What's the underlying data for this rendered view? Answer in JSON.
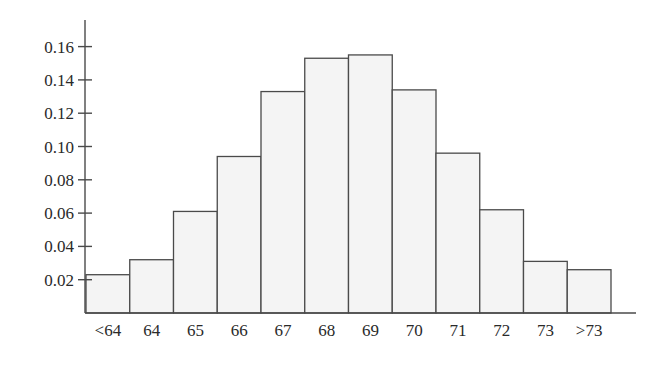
{
  "chart_data": {
    "type": "bar",
    "title": "",
    "xlabel": "",
    "ylabel": "",
    "categories": [
      "<64",
      "64",
      "65",
      "66",
      "67",
      "68",
      "69",
      "70",
      "71",
      "72",
      "73",
      ">73"
    ],
    "values": [
      0.023,
      0.032,
      0.061,
      0.094,
      0.133,
      0.153,
      0.155,
      0.134,
      0.096,
      0.062,
      0.031,
      0.026
    ],
    "ylim": [
      0,
      0.176
    ],
    "yticks": [
      0.02,
      0.04,
      0.06,
      0.08,
      0.1,
      0.12,
      0.14,
      0.16
    ],
    "ytick_labels": [
      "0.02",
      "0.04",
      "0.06",
      "0.08",
      "0.10",
      "0.12",
      "0.14",
      "0.16"
    ],
    "grid": false,
    "legend": null,
    "bar_style": "histogram, adjacent bars, light gray fill with dark outline",
    "colors": {
      "bar_fill": "#f4f4f4",
      "bar_stroke": "#4a4a4a",
      "axis": "#4a4a4a"
    }
  }
}
